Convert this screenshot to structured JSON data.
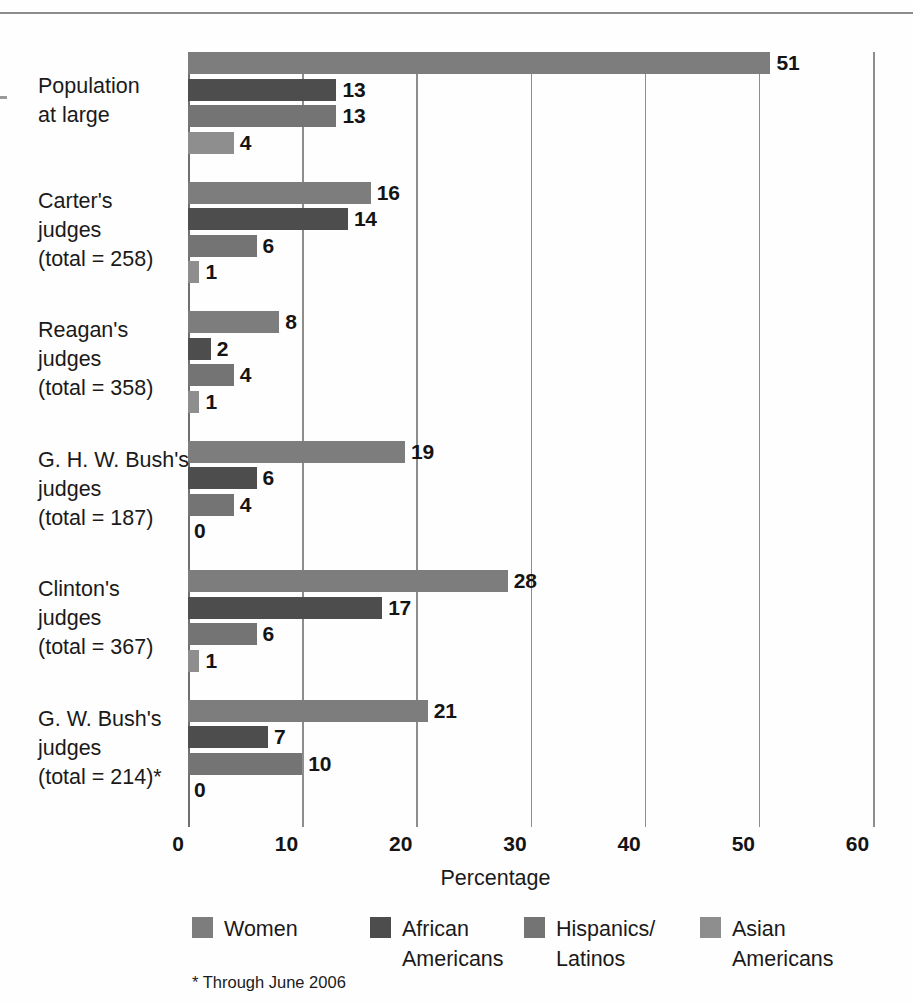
{
  "figure": {
    "footnote": "* Through June 2006"
  },
  "chart_data": {
    "type": "bar",
    "orientation": "horizontal",
    "title": "",
    "xlabel": "Percentage",
    "ylabel": "",
    "xlim": [
      0,
      60
    ],
    "xticks": [
      0,
      10,
      20,
      30,
      40,
      50,
      60
    ],
    "xtick_labels": [
      "0",
      "10",
      "20",
      "30",
      "40",
      "50",
      "60"
    ],
    "grid": true,
    "grid_axis": "x",
    "legend_position": "bottom",
    "categories": [
      "Population at large",
      "Carter's judges (total = 258)",
      "Reagan's judges (total = 358)",
      "G. H. W. Bush's judges (total = 187)",
      "Clinton's judges (total = 367)",
      "G. W. Bush's judges (total = 214)*"
    ],
    "category_label_lines": [
      [
        "Population",
        "at large"
      ],
      [
        "Carter's",
        "judges",
        "(total = 258)"
      ],
      [
        "Reagan's",
        "judges",
        "(total = 358)"
      ],
      [
        "G. H. W. Bush's",
        "judges",
        "(total = 187)"
      ],
      [
        "Clinton's",
        "judges",
        "(total = 367)"
      ],
      [
        "G. W. Bush's",
        "judges",
        "(total = 214)*"
      ]
    ],
    "series": [
      {
        "name": "Women",
        "color": "#7d7d7d",
        "values": [
          51,
          16,
          8,
          19,
          28,
          21
        ]
      },
      {
        "name": "African Americans",
        "color": "#4d4d4d",
        "values": [
          13,
          14,
          2,
          6,
          17,
          7
        ]
      },
      {
        "name": "Hispanics/Latinos",
        "color": "#747474",
        "values": [
          13,
          6,
          4,
          4,
          6,
          10
        ]
      },
      {
        "name": "Asian Americans",
        "color": "#8e8e8e",
        "values": [
          4,
          1,
          1,
          0,
          1,
          0
        ]
      }
    ],
    "legend_entries": [
      {
        "label": "Women",
        "lines": [
          "Women"
        ],
        "color": "#7d7d7d"
      },
      {
        "label": "African Americans",
        "lines": [
          "African",
          "Americans"
        ],
        "color": "#4d4d4d"
      },
      {
        "label": "Hispanics/Latinos",
        "lines": [
          "Hispanics/",
          "Latinos"
        ],
        "color": "#747474"
      },
      {
        "label": "Asian Americans",
        "lines": [
          "Asian",
          "Americans"
        ],
        "color": "#8e8e8e"
      }
    ]
  }
}
